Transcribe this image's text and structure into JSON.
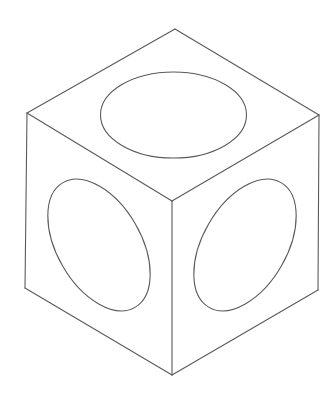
{
  "diagram": {
    "type": "isometric-line-drawing",
    "canvas": {
      "width": 336,
      "height": 400,
      "background": "#ffffff"
    },
    "stroke_color": "#5a5a5a",
    "vertices": {
      "top": [
        175,
        29
      ],
      "left_top": [
        27,
        113
      ],
      "right_top": [
        319,
        115
      ],
      "center": [
        172,
        201
      ],
      "left_bottom": [
        25,
        288
      ],
      "right_bottom": [
        318,
        290
      ],
      "bottom": [
        172,
        375
      ]
    },
    "faces": [
      {
        "name": "top-face",
        "hole": {
          "cx": 173.5,
          "cy": 115,
          "rx": 73,
          "ry": 43,
          "rotation": 0
        }
      },
      {
        "name": "left-face",
        "hole": {
          "cx": 99,
          "cy": 245,
          "rx": 72,
          "ry": 42,
          "rotation": 60
        }
      },
      {
        "name": "right-face",
        "hole": {
          "cx": 245,
          "cy": 245,
          "rx": 72,
          "ry": 42,
          "rotation": -60
        }
      }
    ]
  }
}
